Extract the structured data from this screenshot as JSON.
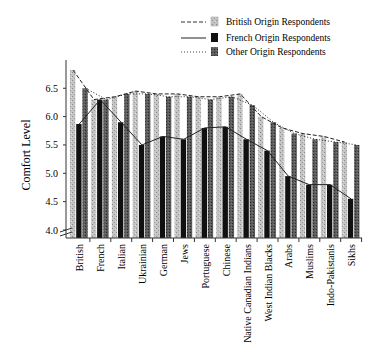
{
  "chart_data": {
    "type": "bar",
    "title": "",
    "xlabel": "",
    "ylabel": "Comfort Level",
    "ylim": [
      4.0,
      6.9
    ],
    "yticks": [
      4.0,
      4.5,
      5.0,
      5.5,
      6.0,
      6.5
    ],
    "ytick_labels": [
      "4.0",
      "4.5",
      "5.0",
      "5.5",
      "6.0",
      "6.5"
    ],
    "axis_break": true,
    "grid": false,
    "legend_position": "top-right",
    "categories": [
      "British",
      "French",
      "Italian",
      "Ukrainian",
      "German",
      "Jews",
      "Portuguese",
      "Chinese",
      "Native Canadian Indians",
      "West Indian Blacks",
      "Arabs",
      "Muslims",
      "Indo-Pakistanis",
      "Sikhs"
    ],
    "series": [
      {
        "name": "British Origin Respondents",
        "line_style": "dashed",
        "bar_fill": "light speckled gray",
        "values": [
          6.82,
          6.3,
          6.35,
          6.45,
          6.4,
          6.4,
          6.35,
          6.35,
          6.4,
          6.0,
          5.8,
          5.7,
          5.65,
          5.55
        ]
      },
      {
        "name": "French Origin Respondents",
        "line_style": "solid",
        "bar_fill": "black",
        "values": [
          5.87,
          6.3,
          5.9,
          5.5,
          5.65,
          5.6,
          5.8,
          5.82,
          5.6,
          5.4,
          4.95,
          4.8,
          4.8,
          4.55
        ]
      },
      {
        "name": "Other Origin Respondents",
        "line_style": "dotted",
        "bar_fill": "dark gray",
        "values": [
          6.5,
          6.3,
          6.4,
          6.4,
          6.35,
          6.35,
          6.3,
          6.35,
          6.2,
          5.9,
          5.7,
          5.6,
          5.55,
          5.5
        ]
      }
    ]
  },
  "legend": {
    "items": [
      {
        "label": "British Origin Respondents",
        "color": "#bdbdbd"
      },
      {
        "label": "French Origin Respondents",
        "color": "#111111"
      },
      {
        "label": "Other Origin Respondents",
        "color": "#3a3a3a"
      }
    ]
  },
  "axis": {
    "ylabel": "Comfort Level"
  }
}
